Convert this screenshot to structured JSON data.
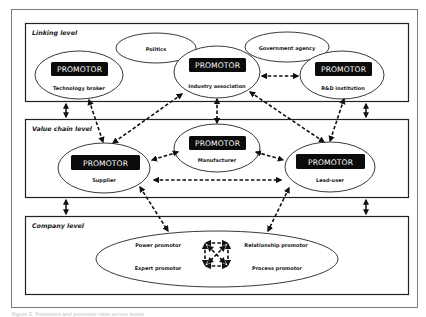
{
  "diagram": {
    "levels": {
      "linking": {
        "label": "Linking level"
      },
      "value_chain": {
        "label": "Value chain level"
      },
      "company": {
        "label": "Company level"
      }
    },
    "promotor_label": "PROMOTOR",
    "linking_nodes": {
      "politics": "Politics",
      "government_agency": "Government agency",
      "technology_broker": "Technology broker",
      "industry_association": "Industry association",
      "rd_institution": "R&D institution"
    },
    "value_chain_nodes": {
      "supplier": "Supplier",
      "manufacturer": "Manufacturer",
      "lead_user": "Lead-user"
    },
    "company_roles": {
      "power": "Power promotor",
      "relationship": "Relationship promotor",
      "expert": "Expert promotor",
      "process": "Process promotor"
    },
    "caption": "Figure 2. Promotors and promotor roles across levels"
  }
}
